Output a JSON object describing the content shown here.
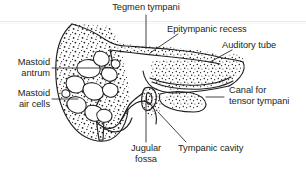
{
  "figure": {
    "kind": "anatomical-line-drawing",
    "background_color": "#ffffff",
    "ink_color": "#231f20",
    "artifact_line_color": "#e3e3e3"
  },
  "labels": {
    "tegmen_tympani": "Tegmen tympani",
    "epitympanic_recess": "Epitympanic recess",
    "auditory_tube": "Auditory tube",
    "canal_for_tensor_tympani_line1": "Canal for",
    "canal_for_tensor_tympani_line2": "tensor tympani",
    "mastoid_antrum_line1": "Mastoid",
    "mastoid_antrum_line2": "antrum",
    "mastoid_air_cells_line1": "Mastoid",
    "mastoid_air_cells_line2": "air cells",
    "jugular_fossa_line1": "Jugular",
    "jugular_fossa_line2": "fossa",
    "tympanic_cavity": "Tympanic cavity"
  }
}
